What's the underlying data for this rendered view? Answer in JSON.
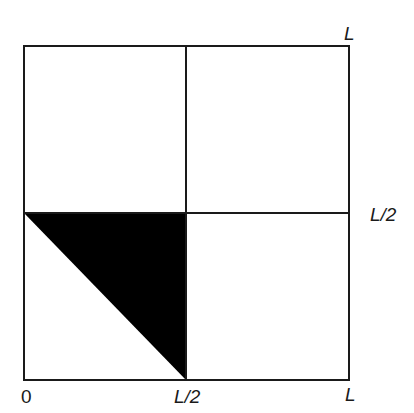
{
  "diagram": {
    "labels": {
      "top_right": "L",
      "right_mid": "L/2",
      "bottom_origin": "0",
      "bottom_mid": "L/2",
      "bottom_right": "L"
    },
    "colors": {
      "stroke": "#1a1a1a",
      "fill_triangle": "#000000",
      "background": "#ffffff"
    },
    "shaded_region": {
      "shape": "triangle",
      "vertices_in_L_units": [
        [
          0,
          0.5
        ],
        [
          0.5,
          0.5
        ],
        [
          0.5,
          0
        ]
      ]
    }
  }
}
